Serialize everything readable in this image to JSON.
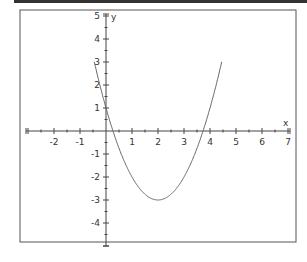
{
  "chart_data": {
    "type": "line",
    "title": "",
    "function": "y = x^2 - 4x + 1",
    "xlabel": "x",
    "ylabel": "y",
    "xlim": [
      -3,
      7
    ],
    "ylim": [
      -5,
      5
    ],
    "grid": false,
    "x_ticks": [
      -2,
      -1,
      1,
      2,
      3,
      4,
      5,
      6,
      7
    ],
    "y_ticks": [
      5,
      4,
      3,
      2,
      1,
      -1,
      -2,
      -3,
      -4
    ],
    "series": [
      {
        "name": "parabola",
        "x": [
          -0.2,
          0,
          0.5,
          1,
          1.5,
          2,
          2.5,
          3,
          3.5,
          4,
          4.2
        ],
        "y": [
          1.84,
          1,
          -0.75,
          -2,
          -2.75,
          -3,
          -2.75,
          -2,
          -0.75,
          1,
          1.84
        ]
      }
    ],
    "annotations": {
      "vertex": [
        2,
        -3
      ],
      "y_intercept": [
        0,
        1
      ],
      "x_intercepts": [
        0.27,
        3.73
      ]
    }
  },
  "labels": {
    "x_axis": "x",
    "y_axis": "y",
    "x_ticks": [
      "-2",
      "-1",
      "1",
      "2",
      "3",
      "4",
      "5",
      "6",
      "7"
    ],
    "y_ticks": [
      "5",
      "4",
      "3",
      "2",
      "1",
      "-1",
      "-2",
      "-3",
      "-4"
    ]
  },
  "colors": {
    "curve": "#666666",
    "axis": "#444444",
    "frame": "#555555"
  }
}
